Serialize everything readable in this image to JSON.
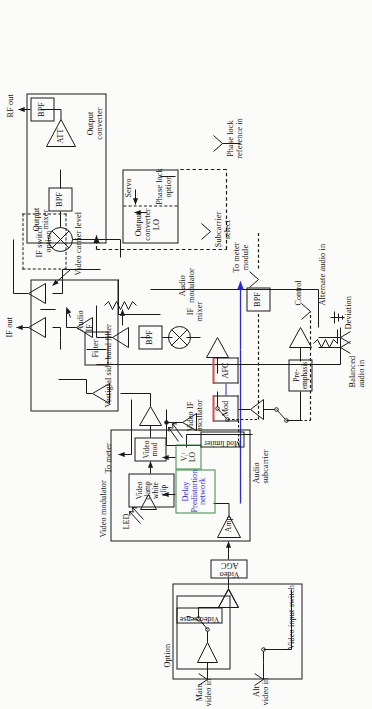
{
  "figure": {
    "type": "block-diagram",
    "orientation": "rotated-90-ccw"
  },
  "groups": {
    "video_input_switch": "Video input switch",
    "option": "Option",
    "video_modulator": "Video modulator",
    "vestigial_side_band_filter": "Vestigial side band filter",
    "if_switch_option": "IF switch\noption",
    "output_mixer": "Output\nmixer",
    "output_converter": "Output\nconverter",
    "output_converter_lo": "Output\nconverter\nLO",
    "phase_lock_option": "Phase lock\noption",
    "servo": "Servo",
    "audio_modulator": "Audio\nmodulator",
    "audio_subcarrier": "Audio\nsubcarrier",
    "video_if_oscillator": "Video IF\noscillator",
    "if_mixer": "IF\nmixer"
  },
  "blocks": {
    "video_sense": "Video sense",
    "video_agc": "Video\nAGC",
    "amp": "Amp",
    "delay_predistortion": "Delay\nPredistortion\nnetwork",
    "video_clamp_white_clip": "Video\nclamp\nwhite\nclip",
    "video_mod": "Video\nmod",
    "vf_lo": "Vᵢᶠ\nLO",
    "filter": "Filter",
    "bpf_audio": "BPF",
    "bpf_subcarrier": "BPF",
    "bpf_out1": "BPF",
    "bpf_out2": "BPF",
    "att": "ATT",
    "mod_limiter": "Mod limiter",
    "mod": "Mod",
    "afc": "AFC",
    "pre_emphasis": "Pre-emphasis"
  },
  "ports": {
    "main_video_in": "Main\nvideo in",
    "alt_video_in": "Alt\nvideo in",
    "balanced_audio_in": "Balanced\naudio in",
    "alternate_audio_in": "Alternate audio in",
    "control": "Control",
    "subcarrier_select": "Subcarrier\nselect",
    "phase_lock_reference_in": "Phase lock\nreference in",
    "if_out": "IF out",
    "rf_out": "RF out",
    "to_meter": "To meter",
    "to_meter_module": "To meter\nmodule",
    "audio_if": "Audio\nIF",
    "video_carrier_level": "Video carrier level",
    "deviation": "Deviation",
    "led": "LED"
  },
  "colors": {
    "ink": "#1a1a1a",
    "accent_blue": "#2b2bd0",
    "accent_red": "#e04a4a",
    "accent_green": "#3a8a4a",
    "paper": "#fbfbfa"
  }
}
